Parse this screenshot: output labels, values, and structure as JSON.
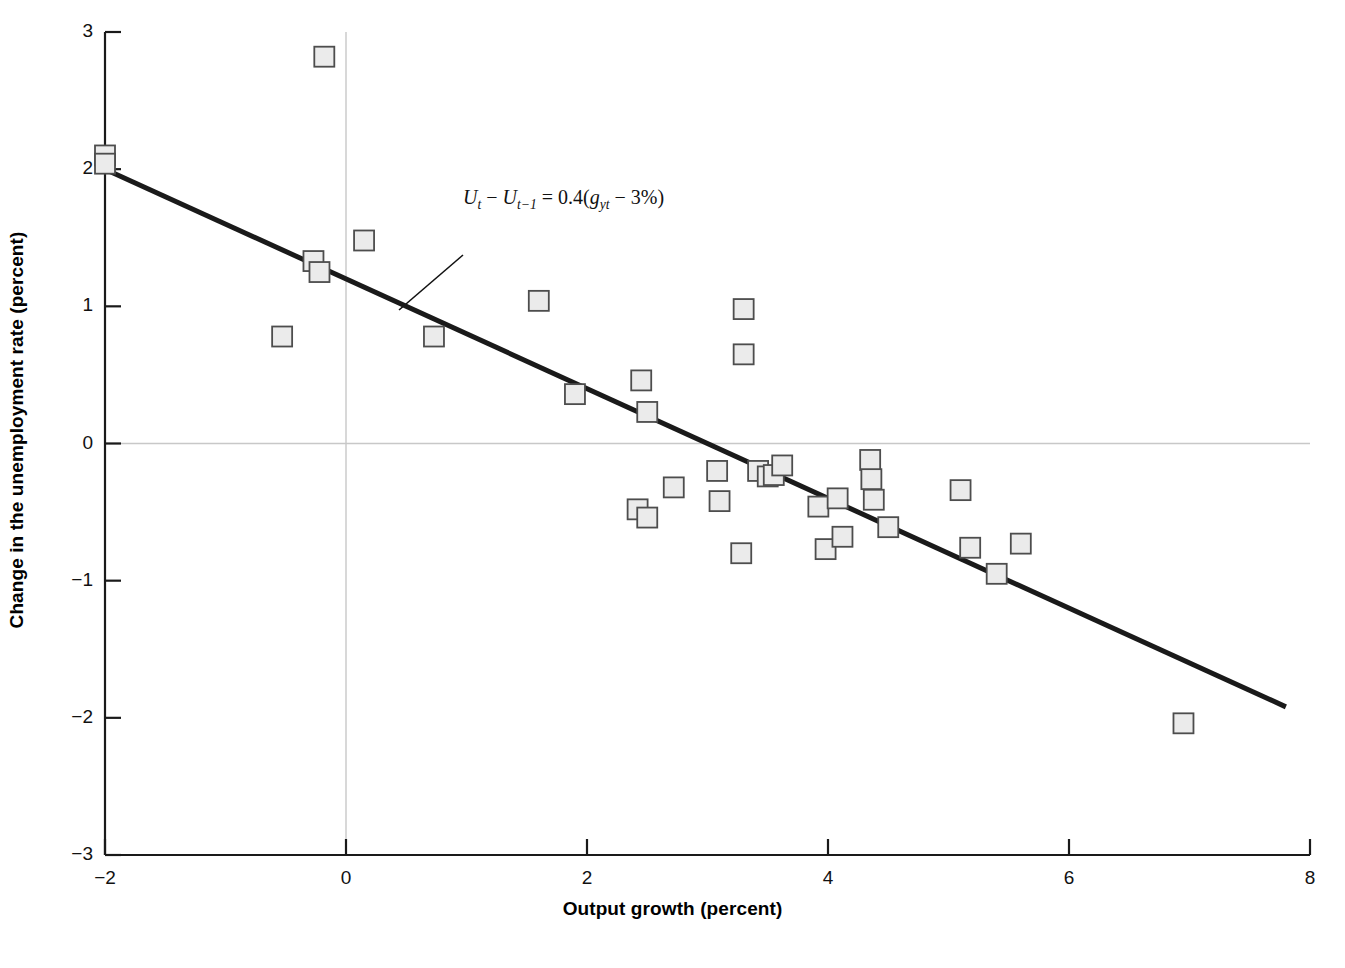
{
  "chart_data": {
    "type": "scatter",
    "title": "",
    "xlabel": "Output growth (percent)",
    "ylabel": "Change in the unemployment rate (percent)",
    "xlim": [
      -2,
      8
    ],
    "ylim": [
      -3,
      3
    ],
    "xticks": [
      -2,
      0,
      2,
      4,
      6,
      8
    ],
    "yticks": [
      -3,
      -2,
      -1,
      0,
      1,
      2,
      3
    ],
    "xtick_labels": [
      "−2",
      "0",
      "2",
      "4",
      "6",
      "8"
    ],
    "ytick_labels": [
      "−3",
      "−2",
      "−1",
      "0",
      "1",
      "2",
      "3"
    ],
    "grid": "zero-lines-only",
    "legend": "none",
    "marker": {
      "shape": "square",
      "fill_color": "#ebebeb",
      "edge_color": "#4d4d4d",
      "size_px": 20
    },
    "series": [
      {
        "name": "Annual observations",
        "points": [
          [
            -2.0,
            2.1
          ],
          [
            -2.0,
            2.04
          ],
          [
            -0.18,
            2.82
          ],
          [
            -0.27,
            1.33
          ],
          [
            -0.22,
            1.25
          ],
          [
            0.15,
            1.48
          ],
          [
            -0.53,
            0.78
          ],
          [
            0.73,
            0.78
          ],
          [
            1.6,
            1.04
          ],
          [
            1.9,
            0.36
          ],
          [
            2.45,
            0.46
          ],
          [
            2.5,
            0.23
          ],
          [
            3.3,
            0.98
          ],
          [
            3.3,
            0.65
          ],
          [
            2.42,
            -0.48
          ],
          [
            2.5,
            -0.54
          ],
          [
            2.72,
            -0.32
          ],
          [
            3.08,
            -0.2
          ],
          [
            3.1,
            -0.42
          ],
          [
            3.28,
            -0.8
          ],
          [
            3.42,
            -0.2
          ],
          [
            3.5,
            -0.24
          ],
          [
            3.55,
            -0.23
          ],
          [
            3.62,
            -0.16
          ],
          [
            3.92,
            -0.46
          ],
          [
            3.98,
            -0.77
          ],
          [
            4.08,
            -0.4
          ],
          [
            4.12,
            -0.68
          ],
          [
            4.35,
            -0.12
          ],
          [
            4.36,
            -0.26
          ],
          [
            4.38,
            -0.41
          ],
          [
            4.5,
            -0.61
          ],
          [
            5.1,
            -0.34
          ],
          [
            5.18,
            -0.76
          ],
          [
            5.4,
            -0.95
          ],
          [
            5.6,
            -0.73
          ],
          [
            6.95,
            -2.04
          ]
        ]
      }
    ],
    "fit_line": {
      "name": "Okun's law regression line",
      "equation_text": "Ut − Ut−1 = 0.4(gyt − 3%)",
      "slope": -0.4,
      "intercept": 1.2,
      "x_start": -2.0,
      "x_end": 7.8,
      "y_start": 2.0,
      "y_end": -1.92,
      "color": "#1a1a1a",
      "width_px": 5
    },
    "annotation": {
      "equation_lhs_var": "U",
      "equation_sub_t": "t",
      "equation_sub_t1": "t−1",
      "coefficient": "0.4",
      "growth_var": "g",
      "growth_sub": "yt",
      "constant": "3%",
      "leader_line": {
        "from": [
          463,
          255
        ],
        "to": [
          399,
          310
        ]
      }
    }
  },
  "axes": {
    "x_title": "Output growth (percent)",
    "y_title": "Change in the unemployment rate (percent)"
  },
  "equation": {
    "full_text": "Uₜ − Uₜ₋₁ = 0.4(gᵧₜ − 3%)",
    "part_u1": "U",
    "part_sub1": "t",
    "part_minus": " − ",
    "part_u2": "U",
    "part_sub2": "t−1",
    "part_equals": " = 0.4(",
    "part_g": "g",
    "part_gsub": "yt",
    "part_tail": " − 3%)"
  },
  "colors": {
    "axis": "#1a1a1a",
    "gridline": "#c8c8c8",
    "marker_fill": "#ebebeb",
    "marker_edge": "#4d4d4d",
    "fit_line": "#1a1a1a",
    "text": "#111111"
  }
}
